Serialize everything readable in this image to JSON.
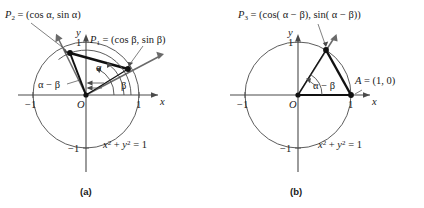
{
  "figure": {
    "panels": [
      {
        "id": "a",
        "caption": "(a)",
        "axis_x_label": "x",
        "axis_y_label": "y",
        "circle_equation_x": "x",
        "circle_equation_sup1": "2",
        "circle_equation_plus": " + ",
        "circle_equation_y": "y",
        "circle_equation_sup2": "2",
        "circle_equation_eq": " = 1",
        "origin_label": "O",
        "ticks": {
          "x_neg": "−1",
          "x_pos": "1",
          "y_pos": "1",
          "y_neg": "−1"
        },
        "point_labels": [
          {
            "name": "P2",
            "prefix": "P",
            "subscript": "2",
            "text": " = (cos α, sin α)"
          },
          {
            "name": "P1",
            "prefix": "P",
            "subscript": "1",
            "text": " = (cos β, sin β)"
          }
        ],
        "angles": [
          {
            "name": "alpha",
            "text": "α"
          },
          {
            "name": "beta",
            "text": "β"
          },
          {
            "name": "alpha-minus-beta",
            "text": "α − β"
          }
        ]
      },
      {
        "id": "b",
        "caption": "(b)",
        "axis_x_label": "x",
        "axis_y_label": "y",
        "circle_equation_x": "x",
        "circle_equation_sup1": "2",
        "circle_equation_plus": " + ",
        "circle_equation_y": "y",
        "circle_equation_sup2": "2",
        "circle_equation_eq": " = 1",
        "origin_label": "O",
        "ticks": {
          "x_neg": "−1",
          "x_pos": "1",
          "y_pos": "1",
          "y_neg": "−1"
        },
        "point_labels": [
          {
            "name": "P3",
            "prefix": "P",
            "subscript": "3",
            "text": " = (cos( α − β), sin( α − β))"
          },
          {
            "name": "A",
            "prefix": "A",
            "subscript": "",
            "text": " = (1, 0)"
          }
        ],
        "angles": [
          {
            "name": "alpha-minus-beta",
            "text": "α − β"
          }
        ]
      }
    ],
    "colors": {
      "stroke": "#3a3a3a",
      "chord": "#111111",
      "text": "#1a1a1a",
      "background": "#ffffff"
    }
  }
}
